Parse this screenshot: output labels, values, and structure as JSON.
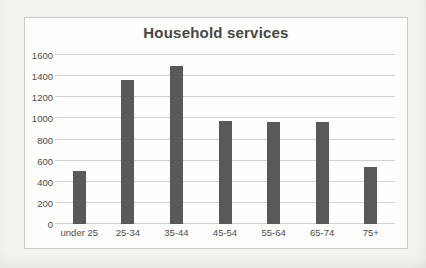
{
  "chart_data": {
    "type": "bar",
    "title": "Household services",
    "categories": [
      "under 25",
      "25-34",
      "35-44",
      "45-54",
      "55-64",
      "65-74",
      "75+"
    ],
    "values": [
      505,
      1360,
      1500,
      975,
      970,
      965,
      540
    ],
    "xlabel": "",
    "ylabel": "",
    "ylim": [
      0,
      1600
    ],
    "yticks": [
      0,
      200,
      400,
      600,
      800,
      1000,
      1200,
      1400,
      1600
    ],
    "grid": true,
    "legend": "none"
  },
  "colors": {
    "page_bg": "#f3f2ee",
    "chart_bg": "#fdfdfc",
    "chart_border": "#c9c8c3",
    "gridline": "#d2d1cc",
    "bar": "#595959",
    "title_text": "#474747",
    "axis_text": "#4c4c4c"
  }
}
